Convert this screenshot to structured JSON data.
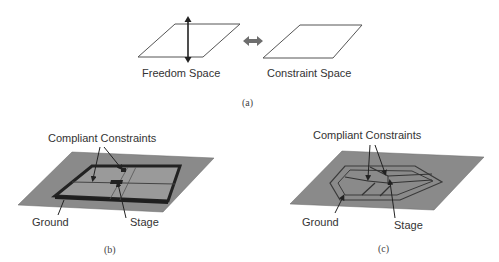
{
  "figure": {
    "panel_a": {
      "caption": "(a)",
      "left_label": "Freedom Space",
      "right_label": "Constraint Space",
      "connector": "double-arrow"
    },
    "panel_b": {
      "caption": "(b)",
      "top_label": "Compliant Constraints",
      "ground_label": "Ground",
      "stage_label": "Stage"
    },
    "panel_c": {
      "caption": "(c)",
      "top_label": "Compliant Constraints",
      "ground_label": "Ground",
      "stage_label": "Stage"
    },
    "colors": {
      "plate": "#8a8a8a",
      "frame": "#2a2a2a",
      "line": "#222222",
      "arrow_gray": "#6e6e6e"
    }
  }
}
